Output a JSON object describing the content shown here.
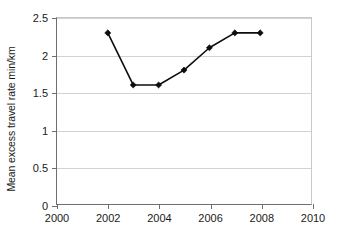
{
  "chart_data": {
    "type": "line",
    "title": "",
    "subtitle": "",
    "xlabel": "",
    "ylabel": "Mean excess travel rate min/km",
    "xlim": [
      2000,
      2010
    ],
    "ylim": [
      0,
      2.5
    ],
    "xticks": [
      2000,
      2002,
      2004,
      2006,
      2008,
      2010
    ],
    "xtick_labels": [
      "2000",
      "2002",
      "2004",
      "2006",
      "2008",
      "2010"
    ],
    "yticks": [
      0,
      0.5,
      1,
      1.5,
      2,
      2.5
    ],
    "ytick_labels": [
      "0",
      "0.5",
      "1",
      "1.5",
      "2",
      "2.5"
    ],
    "grid": "horizontal",
    "legend": "none",
    "marker": "diamond",
    "line_color": "#0d0d0d",
    "grid_color": "#d2d2d2",
    "axis_color": "#6e6e6e",
    "background": "#ffffff",
    "x": [
      2002,
      2003,
      2004,
      2005,
      2006,
      2007,
      2008
    ],
    "series": [
      {
        "name": "Mean excess travel rate",
        "values": [
          2.3,
          1.6,
          1.6,
          1.8,
          2.1,
          2.3,
          2.3
        ]
      }
    ],
    "points": [
      {
        "x": 2002,
        "y": 2.3
      },
      {
        "x": 2003,
        "y": 1.6
      },
      {
        "x": 2004,
        "y": 1.6
      },
      {
        "x": 2005,
        "y": 1.8
      },
      {
        "x": 2006,
        "y": 2.1
      },
      {
        "x": 2007,
        "y": 2.3
      },
      {
        "x": 2008,
        "y": 2.3
      }
    ],
    "annotations": []
  }
}
